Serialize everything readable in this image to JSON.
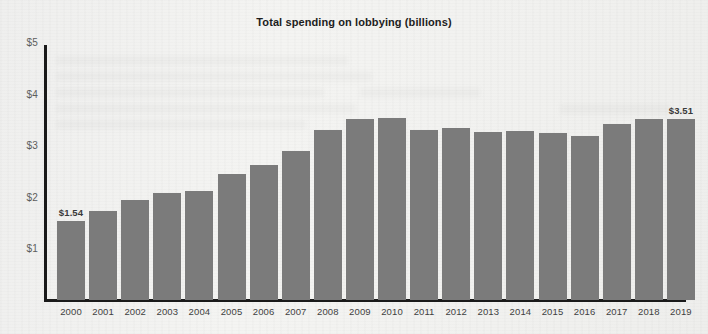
{
  "page": {
    "title": "Total spending on lobbying (billions)"
  },
  "chart_data": {
    "type": "bar",
    "title": "Total spending on lobbying (billions)",
    "xlabel": "",
    "ylabel": "",
    "ylim": [
      0,
      5
    ],
    "grid": false,
    "legend": "none",
    "bar_color": "#7b7b7b",
    "axis_color": "#1a1a1a",
    "y_ticks": [
      1,
      2,
      3,
      4,
      5
    ],
    "y_tick_labels": [
      "$1",
      "$2",
      "$3",
      "$4",
      "$5"
    ],
    "categories": [
      "2000",
      "2001",
      "2002",
      "2003",
      "2004",
      "2005",
      "2006",
      "2007",
      "2008",
      "2009",
      "2010",
      "2011",
      "2012",
      "2013",
      "2014",
      "2015",
      "2016",
      "2017",
      "2018",
      "2019"
    ],
    "values": [
      1.54,
      1.72,
      1.94,
      2.08,
      2.12,
      2.45,
      2.62,
      2.89,
      3.3,
      3.51,
      3.53,
      3.3,
      3.34,
      3.25,
      3.27,
      3.23,
      3.18,
      3.41,
      3.51,
      3.51
    ],
    "point_labels": {
      "0": "$1.54",
      "19": "$3.51"
    },
    "annotations": [
      {
        "category": "2000",
        "text": "$1.54"
      },
      {
        "category": "2019",
        "text": "$3.51"
      }
    ]
  }
}
